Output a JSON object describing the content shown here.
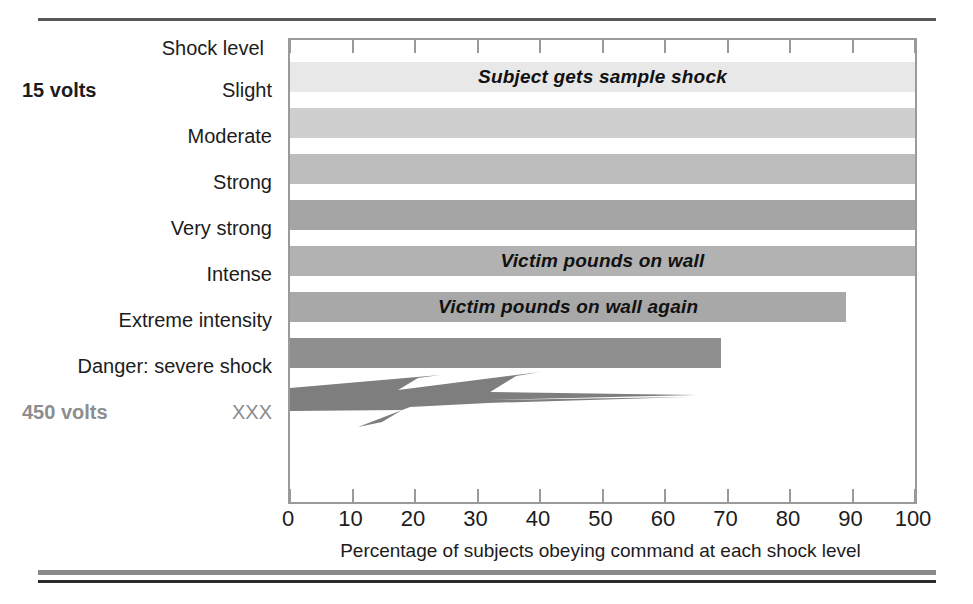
{
  "chart_data": {
    "type": "bar",
    "orientation": "horizontal",
    "title": "",
    "xlabel": "Percentage of subjects obeying command at each shock level",
    "ylabel": "Shock level",
    "xlim": [
      0,
      100
    ],
    "xticks": [
      0,
      10,
      20,
      30,
      40,
      50,
      60,
      70,
      80,
      90,
      100
    ],
    "xtick_labels": [
      "0",
      "10",
      "20",
      "30",
      "40",
      "50",
      "60",
      "70",
      "80",
      "90",
      "100"
    ],
    "grid": false,
    "legend": null,
    "categories": [
      "Slight",
      "Moderate",
      "Strong",
      "Very strong",
      "Intense",
      "Extreme intensity",
      "Danger: severe shock",
      "XXX"
    ],
    "values": [
      100,
      100,
      100,
      100,
      100,
      89,
      69,
      65
    ],
    "bar_colors": [
      "#e8e8e8",
      "#cfcfcf",
      "#bdbdbd",
      "#a5a5a5",
      "#b2b2b2",
      "#a8a8a8",
      "#8f8f8f",
      "#7e7e7e"
    ],
    "annotations": [
      {
        "category": "Slight",
        "text": "Subject gets sample shock"
      },
      {
        "category": "Intense",
        "text": "Victim pounds on wall"
      },
      {
        "category": "Extreme intensity",
        "text": "Victim pounds on wall again"
      }
    ],
    "voltage_tags": [
      {
        "category": "Slight",
        "text": "15 volts",
        "color": "#1c1c1c"
      },
      {
        "category": "XXX",
        "text": "450 volts",
        "color": "#8d8d8f"
      }
    ],
    "special_marks": [
      {
        "category": "XXX",
        "shape": "lightning-bolt",
        "value": 65
      }
    ]
  },
  "axis": {
    "heading": "Shock level",
    "title": "Percentage of subjects obeying command at each shock level",
    "ticks": [
      "0",
      "10",
      "20",
      "30",
      "40",
      "50",
      "60",
      "70",
      "80",
      "90",
      "100"
    ]
  },
  "rows": [
    {
      "label": "Slight",
      "value": 100,
      "volts": "15 volts",
      "annotation": "Subject gets sample shock",
      "color": "#e8e8e8",
      "label_gray": false,
      "volts_gray": false
    },
    {
      "label": "Moderate",
      "value": 100,
      "volts": "",
      "annotation": "",
      "color": "#cfcfcf",
      "label_gray": false,
      "volts_gray": false
    },
    {
      "label": "Strong",
      "value": 100,
      "volts": "",
      "annotation": "",
      "color": "#bdbdbd",
      "label_gray": false,
      "volts_gray": false
    },
    {
      "label": "Very strong",
      "value": 100,
      "volts": "",
      "annotation": "",
      "color": "#a5a5a5",
      "label_gray": false,
      "volts_gray": false
    },
    {
      "label": "Intense",
      "value": 100,
      "volts": "",
      "annotation": "Victim pounds on wall",
      "color": "#b2b2b2",
      "label_gray": false,
      "volts_gray": false
    },
    {
      "label": "Extreme intensity",
      "value": 89,
      "volts": "",
      "annotation": "Victim pounds on wall again",
      "color": "#a8a8a8",
      "label_gray": false,
      "volts_gray": false
    },
    {
      "label": "Danger: severe shock",
      "value": 69,
      "volts": "",
      "annotation": "",
      "color": "#8f8f8f",
      "label_gray": false,
      "volts_gray": false
    },
    {
      "label": "XXX",
      "value": 65,
      "volts": "450 volts",
      "annotation": "",
      "color": "#7e7e7e",
      "label_gray": true,
      "volts_gray": true
    }
  ],
  "colors": {
    "bolt": "#7e7e7e",
    "plot_border": "#9a9a9c",
    "rule_top": "#58585a",
    "rule_bottom_gray": "#8a8a8c",
    "rule_bottom_black": "#2b2b2d",
    "text": "#1c1c1c",
    "text_gray": "#8d8d8f"
  }
}
